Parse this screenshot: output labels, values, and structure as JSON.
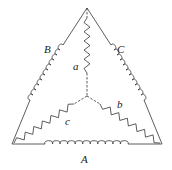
{
  "diagram": {
    "type": "delta-wye network",
    "coils": [
      {
        "id": "A",
        "label": "A",
        "kind": "inductor",
        "side": "bottom"
      },
      {
        "id": "B",
        "label": "B",
        "kind": "inductor",
        "side": "left"
      },
      {
        "id": "C",
        "label": "C",
        "kind": "inductor",
        "side": "right"
      }
    ],
    "resistors": [
      {
        "id": "a",
        "label": "a",
        "kind": "resistor",
        "branch": "center-to-top"
      },
      {
        "id": "b",
        "label": "b",
        "kind": "resistor",
        "branch": "center-to-bottom-right"
      },
      {
        "id": "c",
        "label": "c",
        "kind": "resistor",
        "branch": "center-to-bottom-left"
      }
    ],
    "line_color": "#333333"
  }
}
